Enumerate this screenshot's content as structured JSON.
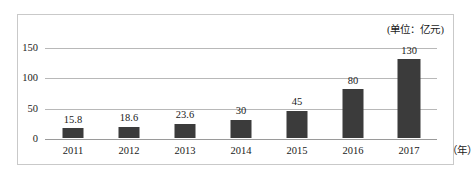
{
  "chart_data": {
    "type": "bar",
    "title": "",
    "subtitle": "",
    "unit_note": "(单位：亿元)",
    "xlabel": "（年）",
    "ylabel": "",
    "categories": [
      "2011",
      "2012",
      "2013",
      "2014",
      "2015",
      "2016",
      "2017"
    ],
    "values": [
      15.8,
      18.6,
      23.6,
      30,
      45,
      80,
      130
    ],
    "value_labels": [
      "15.8",
      "18.6",
      "23.6",
      "30",
      "45",
      "80",
      "130"
    ],
    "ylim": [
      0,
      150
    ],
    "yticks": [
      0,
      50,
      100,
      150
    ],
    "ytick_labels": [
      "0",
      "50",
      "100",
      "150"
    ],
    "grid": true,
    "legend": false,
    "bar_color": "#3b3b3b",
    "gridline_color": "#b8b8b8",
    "axis_color": "#9a9a9a",
    "border_color": "#c9c9c9",
    "text_color": "#1a1a1a"
  }
}
